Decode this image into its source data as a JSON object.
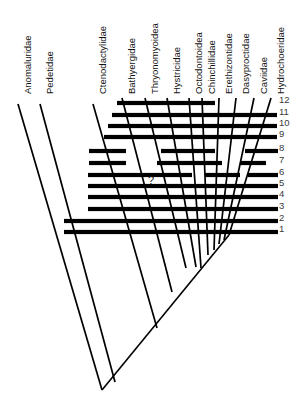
{
  "figure": {
    "kind": "cladogram-with-character-bars",
    "background_color": "#ffffff",
    "line_color": "#000000",
    "label_color": "#111111",
    "number_color": "#3a3a3a",
    "width": 298,
    "height": 413,
    "uncertainty_marker": "?"
  },
  "taxa": [
    {
      "label": "Anomaluridae",
      "label_x": 18,
      "label_y": 100,
      "tip_x": 18,
      "tip_y": 104
    },
    {
      "label": "Pedetidae",
      "label_x": 40,
      "label_y": 100,
      "tip_x": 40,
      "tip_y": 104
    },
    {
      "label": "Ctenodactylidae",
      "label_x": 93,
      "label_y": 100,
      "tip_x": 93,
      "tip_y": 104
    },
    {
      "label": "Bathyergidae",
      "label_x": 122,
      "label_y": 100,
      "tip_x": 122,
      "tip_y": 98
    },
    {
      "label": "Thryonomyoidea",
      "label_x": 145,
      "label_y": 100,
      "tip_x": 145,
      "tip_y": 98
    },
    {
      "label": "Hystricidae",
      "label_x": 167,
      "label_y": 100,
      "tip_x": 167,
      "tip_y": 98
    },
    {
      "label": "Octodontoidea",
      "label_x": 189,
      "label_y": 100,
      "tip_x": 189,
      "tip_y": 98
    },
    {
      "label": "Chinchillidae",
      "label_x": 202,
      "label_y": 100,
      "tip_x": 202,
      "tip_y": 98
    },
    {
      "label": "Erethizontidae",
      "label_x": 219,
      "label_y": 100,
      "tip_x": 219,
      "tip_y": 98
    },
    {
      "label": "Dasyproctidae",
      "label_x": 236,
      "label_y": 100,
      "tip_x": 236,
      "tip_y": 98
    },
    {
      "label": "Caviidae",
      "label_x": 254,
      "label_y": 100,
      "tip_x": 254,
      "tip_y": 98
    },
    {
      "label": "Hydrochoeridae",
      "label_x": 271,
      "label_y": 100,
      "tip_x": 271,
      "tip_y": 98
    }
  ],
  "node_numbers": [
    {
      "label": "12",
      "x": 279,
      "y": 100
    },
    {
      "label": "11",
      "x": 279,
      "y": 112
    },
    {
      "label": "10",
      "x": 279,
      "y": 123
    },
    {
      "label": "9",
      "x": 279,
      "y": 134
    },
    {
      "label": "8",
      "x": 279,
      "y": 148
    },
    {
      "label": "7",
      "x": 279,
      "y": 160
    },
    {
      "label": "6",
      "x": 279,
      "y": 172
    },
    {
      "label": "5",
      "x": 279,
      "y": 183
    },
    {
      "label": "4",
      "x": 279,
      "y": 194
    },
    {
      "label": "3",
      "x": 279,
      "y": 206
    },
    {
      "label": "2",
      "x": 279,
      "y": 218
    },
    {
      "label": "1",
      "x": 279,
      "y": 229
    }
  ],
  "character_bars": [
    {
      "id": 12,
      "y": 103,
      "segments": [
        [
          117,
          215
        ]
      ]
    },
    {
      "id": 11,
      "y": 115,
      "segments": [
        [
          112,
          277
        ]
      ]
    },
    {
      "id": 10,
      "y": 126,
      "segments": [
        [
          108,
          277
        ]
      ]
    },
    {
      "id": 9,
      "y": 137,
      "segments": [
        [
          104,
          277
        ]
      ]
    },
    {
      "id": 8,
      "y": 151,
      "segments": [
        [
          89,
          126
        ],
        [
          161,
          215
        ],
        [
          245,
          278
        ]
      ]
    },
    {
      "id": 7,
      "y": 163,
      "segments": [
        [
          89,
          126
        ],
        [
          157,
          222
        ],
        [
          240,
          266
        ]
      ]
    },
    {
      "id": 6,
      "y": 175,
      "segments": [
        [
          88,
          192
        ],
        [
          205,
          240
        ],
        [
          248,
          278
        ]
      ]
    },
    {
      "id": 5,
      "y": 186,
      "segments": [
        [
          88,
          278
        ]
      ]
    },
    {
      "id": 4,
      "y": 197,
      "segments": [
        [
          88,
          278
        ]
      ]
    },
    {
      "id": 3,
      "y": 209,
      "segments": [
        [
          88,
          278
        ]
      ]
    },
    {
      "id": 2,
      "y": 221,
      "segments": [
        [
          64,
          278
        ]
      ]
    },
    {
      "id": 1,
      "y": 232,
      "segments": [
        [
          64,
          278
        ]
      ]
    }
  ],
  "branches": [
    {
      "from_x": 18,
      "from_y": 104,
      "to_x": 102,
      "to_y": 390
    },
    {
      "from_x": 40,
      "from_y": 104,
      "to_x": 115,
      "to_y": 382
    },
    {
      "from_x": 93,
      "from_y": 104,
      "to_x": 157,
      "to_y": 328
    },
    {
      "from_x": 122,
      "from_y": 98,
      "to_x": 172,
      "to_y": 292
    },
    {
      "from_x": 145,
      "from_y": 98,
      "to_x": 186,
      "to_y": 268
    },
    {
      "from_x": 167,
      "from_y": 98,
      "to_x": 196,
      "to_y": 267
    },
    {
      "from_x": 189,
      "from_y": 98,
      "to_x": 201,
      "to_y": 268
    },
    {
      "from_x": 202,
      "from_y": 98,
      "to_x": 208,
      "to_y": 255
    },
    {
      "from_x": 219,
      "from_y": 98,
      "to_x": 214,
      "to_y": 250
    },
    {
      "from_x": 236,
      "from_y": 98,
      "to_x": 219,
      "to_y": 244
    },
    {
      "from_x": 254,
      "from_y": 98,
      "to_x": 224,
      "to_y": 240
    },
    {
      "from_x": 271,
      "from_y": 98,
      "to_x": 229,
      "to_y": 235
    }
  ],
  "stem": {
    "from_x": 229,
    "from_y": 235,
    "to_x": 102,
    "to_y": 390
  },
  "uncertainty": {
    "symbol": "?",
    "x": 148,
    "y": 174
  }
}
